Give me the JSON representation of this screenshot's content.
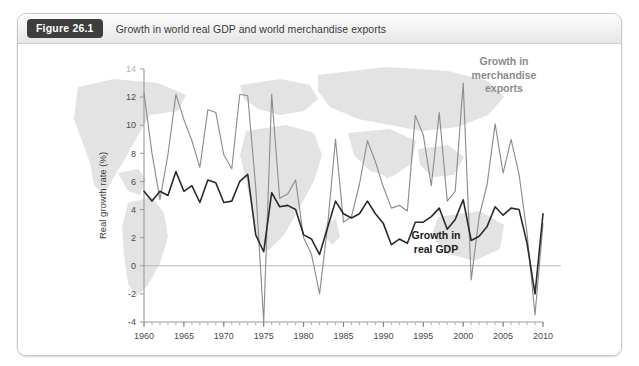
{
  "figure": {
    "badge_label": "Figure 26.1",
    "caption": "Growth in world real GDP and world merchandise exports"
  },
  "colors": {
    "exports_line": "#8e8e8e",
    "gdp_line": "#2b2b2b",
    "axis": "#9a9a9a",
    "zero_line": "#b6b6b6",
    "watermark": "#dcdcdc",
    "badge_bg": "#3e3e3e",
    "card_border": "#c9c9c9"
  },
  "chart_data": {
    "type": "line",
    "title": "Growth in world real GDP and world merchandise exports",
    "xlabel": "",
    "ylabel": "Real growth rate (%)",
    "xlim": [
      1960,
      2010
    ],
    "ylim": [
      -4,
      14
    ],
    "grid": false,
    "legend_position": "inline-annotation",
    "y_ticks": [
      -4,
      -2,
      0,
      2,
      4,
      6,
      8,
      10,
      12,
      14
    ],
    "y_tick_labels": [
      "-4",
      "-2",
      "0",
      "2",
      "4",
      "6",
      "8",
      "10",
      "12",
      "14"
    ],
    "x_ticks": [
      1960,
      1965,
      1970,
      1975,
      1980,
      1985,
      1990,
      1995,
      2000,
      2005,
      2010
    ],
    "x_tick_labels": [
      "1960",
      "1965",
      "1970",
      "1975",
      "1980",
      "1985",
      "1990",
      "1995",
      "2000",
      "2005",
      "2010"
    ],
    "x_minor_tick_interval": 1,
    "annotations": [
      {
        "name": "exports-annotation",
        "text_lines": [
          "Growth in",
          "merchandise",
          "exports"
        ],
        "color": "#8c8c8c"
      },
      {
        "name": "gdp-annotation",
        "text_lines": [
          "Growth in",
          "real GDP"
        ],
        "color": "#1b1b1b"
      }
    ],
    "x": [
      1960,
      1961,
      1962,
      1963,
      1964,
      1965,
      1966,
      1967,
      1968,
      1969,
      1970,
      1971,
      1972,
      1973,
      1974,
      1975,
      1976,
      1977,
      1978,
      1979,
      1980,
      1981,
      1982,
      1983,
      1984,
      1985,
      1986,
      1987,
      1988,
      1989,
      1990,
      1991,
      1992,
      1993,
      1994,
      1995,
      1996,
      1997,
      1998,
      1999,
      2000,
      2001,
      2002,
      2003,
      2004,
      2005,
      2006,
      2007,
      2008,
      2009,
      2010
    ],
    "series": [
      {
        "name": "Growth in merchandise exports",
        "color": "#8e8e8e",
        "values": [
          12.3,
          8.0,
          4.7,
          7.9,
          12.2,
          10.4,
          8.9,
          7.0,
          11.1,
          10.9,
          7.9,
          6.9,
          12.2,
          12.1,
          5.6,
          -4.0,
          12.2,
          4.8,
          5.1,
          6.1,
          2.0,
          0.8,
          -2.0,
          2.8,
          9.0,
          3.1,
          3.5,
          5.8,
          8.9,
          7.4,
          5.6,
          4.1,
          4.3,
          3.9,
          10.7,
          9.3,
          5.7,
          10.9,
          4.6,
          5.3,
          13.0,
          -1.0,
          3.5,
          5.8,
          10.1,
          6.6,
          9.0,
          6.5,
          2.3,
          -3.5,
          3.0
        ]
      },
      {
        "name": "Growth in real GDP",
        "color": "#2b2b2b",
        "values": [
          5.3,
          4.6,
          5.3,
          5.0,
          6.7,
          5.3,
          5.7,
          4.5,
          6.1,
          5.9,
          4.5,
          4.6,
          6.0,
          6.5,
          2.2,
          1.0,
          5.2,
          4.2,
          4.3,
          4.0,
          2.2,
          1.9,
          0.8,
          2.7,
          4.6,
          3.7,
          3.4,
          3.7,
          4.6,
          3.7,
          3.0,
          1.5,
          1.9,
          1.6,
          3.1,
          3.1,
          3.5,
          4.1,
          2.6,
          3.3,
          4.7,
          1.8,
          2.1,
          2.8,
          4.2,
          3.6,
          4.1,
          4.0,
          1.6,
          -2.0,
          3.7
        ]
      }
    ]
  }
}
